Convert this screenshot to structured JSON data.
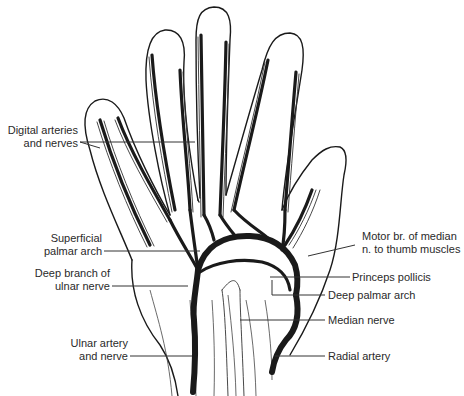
{
  "figure": {
    "labels": {
      "digital_arteries": {
        "line1": "Digital arteries",
        "line2": "and nerves"
      },
      "superficial_palmar_arch": {
        "line1": "Superficial",
        "line2": "palmar arch"
      },
      "deep_branch_ulnar": {
        "line1": "Deep branch of",
        "line2": "ulnar nerve"
      },
      "ulnar_artery": {
        "line1": "Ulnar artery",
        "line2": "and nerve"
      },
      "motor_branch": {
        "line1": "Motor br. of median",
        "line2": "n. to thumb muscles"
      },
      "princeps_pollicis": {
        "line1": "Princeps pollicis"
      },
      "deep_palmar_arch": {
        "line1": "Deep palmar arch"
      },
      "median_nerve": {
        "line1": "Median nerve"
      },
      "radial_artery": {
        "line1": "Radial artery"
      }
    },
    "colors": {
      "background": "#ffffff",
      "ink": "#1a1a1a",
      "label_text": "#2a2a2a"
    }
  }
}
